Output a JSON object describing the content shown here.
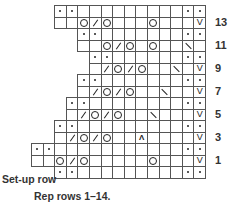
{
  "chart_data": {
    "type": "table",
    "legend_symbols": {
      "dot": "purl",
      "O": "yarn over",
      "/": "k2tog",
      "\\": "ssk",
      "V": "slip stitch",
      "A": "centered double decrease",
      "_": "knit (blank)"
    },
    "grid": {
      "right_edge": 205,
      "top": 5,
      "cell_w": 11.6,
      "cell_h": 11.5
    },
    "rows": [
      {
        "label": "",
        "start_col": 13,
        "cells": [
          ".",
          ".",
          "_",
          "_",
          "_",
          "_",
          "_",
          "_",
          "_",
          "_",
          "_",
          ".",
          "."
        ]
      },
      {
        "label": "13",
        "start_col": 13,
        "cells": [
          "_",
          "_",
          "O",
          "/",
          "O",
          "_",
          "_",
          "_",
          "O",
          "_",
          "_",
          "_",
          "V"
        ]
      },
      {
        "label": "",
        "start_col": 11,
        "cells": [
          ".",
          ".",
          "_",
          "_",
          "_",
          "_",
          "_",
          "_",
          "_",
          ".",
          "."
        ]
      },
      {
        "label": "11",
        "start_col": 11,
        "cells": [
          "_",
          "_",
          "O",
          "/",
          "O",
          "_",
          "O",
          "_",
          "_",
          "\\",
          "_"
        ]
      },
      {
        "label": "",
        "start_col": 10,
        "cells": [
          ".",
          ".",
          "_",
          "_",
          "_",
          "_",
          "_",
          "_",
          ".",
          "."
        ]
      },
      {
        "label": "9",
        "start_col": 10,
        "cells": [
          "_",
          "/",
          "O",
          "/",
          "O",
          "_",
          "_",
          "\\",
          "_",
          "V"
        ]
      },
      {
        "label": "",
        "start_col": 11,
        "cells": [
          ".",
          ".",
          "_",
          "_",
          "_",
          "_",
          "_",
          "_",
          "_",
          ".",
          "."
        ]
      },
      {
        "label": "7",
        "start_col": 11,
        "cells": [
          "_",
          "/",
          "O",
          "/",
          "O",
          "_",
          "_",
          "\\",
          "_",
          "_",
          "V"
        ]
      },
      {
        "label": "",
        "start_col": 12,
        "cells": [
          ".",
          ".",
          "_",
          "_",
          "_",
          "_",
          "_",
          "_",
          "_",
          "_",
          ".",
          "."
        ]
      },
      {
        "label": "5",
        "start_col": 12,
        "cells": [
          "_",
          "/",
          "O",
          "/",
          "O",
          "_",
          "_",
          "\\",
          "_",
          "_",
          "_",
          "V"
        ]
      },
      {
        "label": "",
        "start_col": 13,
        "cells": [
          ".",
          ".",
          "_",
          "_",
          "_",
          "_",
          "_",
          "_",
          "_",
          "_",
          "_",
          ".",
          "."
        ]
      },
      {
        "label": "3",
        "start_col": 13,
        "cells": [
          "_",
          "/",
          "O",
          "/",
          "O",
          "_",
          "_",
          "A",
          "_",
          "_",
          "_",
          "_",
          "V"
        ]
      },
      {
        "label": "",
        "start_col": 15,
        "cells": [
          ".",
          ".",
          "_",
          "_",
          "_",
          "_",
          "_",
          "_",
          "_",
          "_",
          "_",
          "_",
          "_",
          ".",
          "."
        ]
      },
      {
        "label": "1",
        "start_col": 15,
        "cells": [
          "_",
          "_",
          "O",
          "/",
          "O",
          "_",
          "_",
          "_",
          "_",
          "_",
          "O",
          "_",
          "_",
          "_",
          "V"
        ]
      },
      {
        "label": "Set-up row",
        "start_col": 13,
        "cells": [
          ".",
          ".",
          "_",
          "_",
          "_",
          "_",
          "_",
          "_",
          "_",
          "_",
          "_",
          ".",
          "."
        ]
      }
    ]
  },
  "labels": {
    "setup_row": "Set-up row",
    "footer": "Rep rows 1–14."
  }
}
